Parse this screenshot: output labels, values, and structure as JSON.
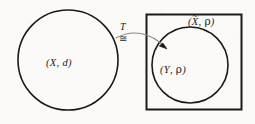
{
  "figure": {
    "background_color": "#fbfaf8",
    "ink_color": "#1c1a18",
    "arrow_color": "#8d8a84"
  },
  "domain_space": {
    "shape": "circle",
    "label_open_paren": "(",
    "label_set": "X",
    "label_comma": ", ",
    "label_metric": "d",
    "label_close_paren": ")",
    "label_full": "(X, d)"
  },
  "completion_space": {
    "shape": "square",
    "label_open_paren": "(",
    "label_set": "X",
    "label_accent": "~",
    "label_comma": ", ",
    "label_metric": "ρ",
    "label_close_paren": ")",
    "label_full": "(X̃, ρ)"
  },
  "image_space": {
    "shape": "circle",
    "label_open_paren": "(",
    "label_set": "Y",
    "label_comma": ", ",
    "label_metric": "ρ",
    "label_close_paren": ")",
    "label_full": "(Y, ρ)"
  },
  "map": {
    "name": "T",
    "relation_symbol": "≅",
    "arrow_style": "curved-with-arrowhead"
  }
}
